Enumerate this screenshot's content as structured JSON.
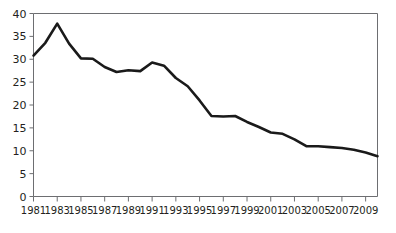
{
  "chart_data": {
    "type": "line",
    "title": "",
    "subtitle": "",
    "xlabel": "",
    "ylabel": "",
    "xlim": [
      1981,
      2010
    ],
    "ylim": [
      0,
      40
    ],
    "grid": false,
    "legend": null,
    "legend_position": "none",
    "line_color": "#1a1a1a",
    "axis_color": "#6d6e71",
    "background_color": "#ffffff",
    "y_ticks": [
      0,
      5,
      10,
      15,
      20,
      25,
      30,
      35,
      40
    ],
    "y_tick_labels": [
      "0",
      "5",
      "10",
      "15",
      "20",
      "25",
      "30",
      "35",
      "40"
    ],
    "x_ticks": [
      1981,
      1983,
      1985,
      1987,
      1989,
      1991,
      1993,
      1995,
      1997,
      1999,
      2001,
      2003,
      2005,
      2007,
      2009
    ],
    "x_tick_labels": [
      "1981",
      "1983",
      "1985",
      "1987",
      "1989",
      "1991",
      "1993",
      "1995",
      "1997",
      "1999",
      "2001",
      "2003",
      "2005",
      "2007",
      "2009"
    ],
    "series": [
      {
        "name": "series-1",
        "x": [
          1981,
          1982,
          1983,
          1984,
          1985,
          1986,
          1987,
          1988,
          1989,
          1990,
          1991,
          1992,
          1993,
          1994,
          1995,
          1996,
          1997,
          1998,
          1999,
          2000,
          2001,
          2002,
          2003,
          2004,
          2005,
          2006,
          2007,
          2008,
          2009,
          2010
        ],
        "values": [
          30.8,
          33.6,
          37.8,
          33.4,
          30.2,
          30.1,
          28.3,
          27.2,
          27.6,
          27.4,
          29.3,
          28.6,
          25.9,
          24.1,
          21.0,
          17.6,
          17.5,
          17.6,
          16.3,
          15.2,
          14.0,
          13.7,
          12.5,
          11.0,
          11.0,
          10.8,
          10.6,
          10.2,
          9.6,
          8.8
        ]
      }
    ]
  }
}
